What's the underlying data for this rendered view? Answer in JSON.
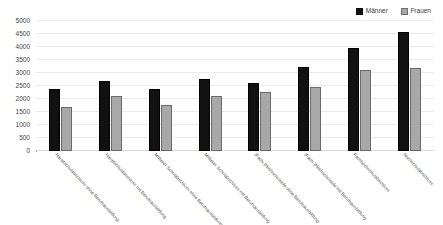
{
  "chart_data": {
    "type": "bar",
    "title": "",
    "xlabel": "",
    "ylabel": "",
    "ylim": [
      0,
      5000
    ],
    "yticks": [
      0,
      500,
      1000,
      1500,
      2000,
      2500,
      3000,
      3500,
      4000,
      4500,
      5000
    ],
    "ytick_labels": [
      "0",
      "500",
      "1000",
      "1500",
      "2000",
      "2500",
      "3000",
      "3500",
      "4000",
      "4500",
      "5000"
    ],
    "grid": true,
    "legend_position": "top-right",
    "categories": [
      "Hauptschulabschluss ohne Berufsausbildung",
      "Hauptschulabschluss mit Berufsausbildung",
      "Mittlerer Schulabschluss ohne Berufsausbildung",
      "Mittlerer Schulabschluss mit Berufsausbildung",
      "(Fach-)Hochschulreife ohne Berufsausbildung",
      "(Fach-)Hochschulreife mit Berufsausbildung",
      "Fachhochschulabschluss",
      "Hochschulabschluss"
    ],
    "series": [
      {
        "name": "Männer",
        "color": "#111111",
        "values": [
          2300,
          2600,
          2300,
          2700,
          2550,
          3150,
          3900,
          4500
        ]
      },
      {
        "name": "Frauen",
        "color": "#a8a8a8",
        "values": [
          1600,
          2050,
          1700,
          2050,
          2200,
          2400,
          3050,
          3100
        ]
      }
    ]
  },
  "legend": {
    "entries": [
      {
        "label": "Männer"
      },
      {
        "label": "Frauen"
      }
    ]
  }
}
